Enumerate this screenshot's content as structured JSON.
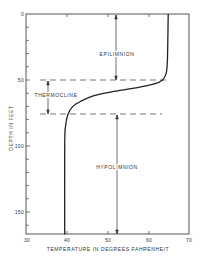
{
  "chart_data": {
    "type": "line",
    "title": "",
    "xlabel": "TEMPERATURE IN DEGREES FAHRENHEIT",
    "ylabel": "DEPTH IN FEET",
    "xlim": [
      30,
      70
    ],
    "ylim": [
      167,
      0
    ],
    "y_inverted": true,
    "grid": false,
    "x_ticks": [
      30,
      40,
      50,
      60,
      70
    ],
    "y_ticks": [
      0,
      50,
      100,
      150
    ],
    "x_tick_labels": [
      "30",
      "40",
      "50",
      "60",
      "70"
    ],
    "y_tick_labels": [
      "0",
      "50",
      "100",
      "150"
    ],
    "series": [
      {
        "name": "Temperature profile",
        "points": [
          {
            "temp": 64.9,
            "depth": 0
          },
          {
            "temp": 64.8,
            "depth": 20
          },
          {
            "temp": 64.7,
            "depth": 35
          },
          {
            "temp": 64.4,
            "depth": 45
          },
          {
            "temp": 63.5,
            "depth": 50
          },
          {
            "temp": 61.5,
            "depth": 53
          },
          {
            "temp": 57.0,
            "depth": 56
          },
          {
            "temp": 51.0,
            "depth": 59
          },
          {
            "temp": 46.5,
            "depth": 62
          },
          {
            "temp": 43.5,
            "depth": 66
          },
          {
            "temp": 41.5,
            "depth": 70
          },
          {
            "temp": 40.3,
            "depth": 76
          },
          {
            "temp": 39.7,
            "depth": 85
          },
          {
            "temp": 39.5,
            "depth": 100
          },
          {
            "temp": 39.5,
            "depth": 167
          }
        ]
      }
    ],
    "zones": [
      {
        "name": "EPILIMNION",
        "from_depth": 0,
        "to_depth": 50
      },
      {
        "name": "THERMOCLINE",
        "from_depth": 50,
        "to_depth": 76
      },
      {
        "name": "HYPOLIMNION",
        "from_depth": 76,
        "to_depth": 167
      }
    ],
    "boundary_lines_depth": [
      50,
      76
    ],
    "annotations": [
      "EPILIMNION",
      "THERMOCLINE",
      "HYPOLIMNION"
    ]
  },
  "labels": {
    "epilimnion": "EPILIMNION",
    "thermocline": "THERMOCLINE",
    "hypolimnion": "HYPOLIMNION",
    "xlabel": "TEMPERATURE IN DEGREES FAHRENHEIT",
    "ylabel": "DEPTH IN FEET",
    "x_ticks": [
      "30",
      "40",
      "50",
      "60",
      "70"
    ],
    "y_ticks": [
      "0",
      "50",
      "100",
      "150"
    ]
  },
  "colors": {
    "line": "#222222",
    "axis": "#444444",
    "text": "#333333",
    "background": "#ffffff"
  }
}
